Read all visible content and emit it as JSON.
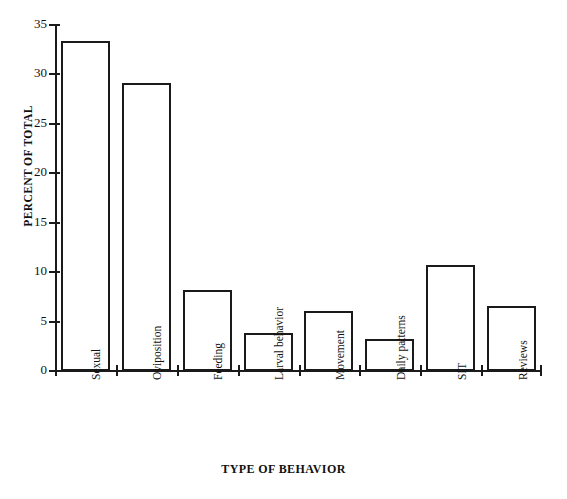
{
  "chart_data": {
    "type": "bar",
    "title": "",
    "subtitle": "",
    "xlabel": "TYPE OF BEHAVIOR",
    "ylabel": "PERCENT OF TOTAL",
    "categories": [
      "Sexual",
      "Oviposition",
      "Feeding",
      "Larval behavior",
      "Movement",
      "Daily patterns",
      "SIT",
      "Reviews"
    ],
    "values": [
      33.4,
      29.1,
      8.2,
      3.8,
      6.1,
      3.2,
      10.7,
      6.6
    ],
    "ylim": [
      0,
      35
    ],
    "yticks": [
      0,
      5,
      10,
      15,
      20,
      25,
      30,
      35
    ],
    "ytick_labels": [
      "0",
      "5",
      "10",
      "15",
      "20",
      "25",
      "30",
      "35"
    ],
    "grid": false,
    "legend": false,
    "legend_position": "none",
    "bar_fill_color": "#ffffff",
    "bar_edge_color": "#1a1a1a",
    "axis_color": "#1a1a1a"
  },
  "figure": {
    "scan_artifact_text": ""
  }
}
